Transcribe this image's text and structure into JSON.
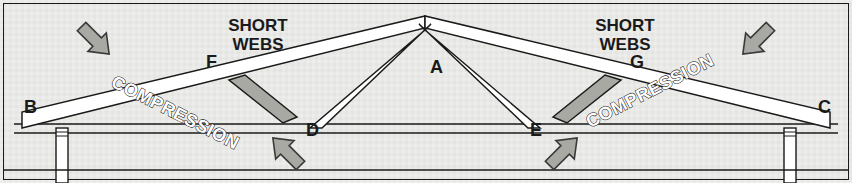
{
  "figure": {
    "name": "roof-truss-compression-diagram",
    "background_color": "#e9e9e7",
    "border_color": "#1a1a1a",
    "member_fill": "#ffffff",
    "member_stroke": "#1a1a1a",
    "short_web_fill": "#a9a9a4",
    "arrow_fill": "#a9a9a4",
    "arrow_stroke": "#3a3a3a",
    "text_color": "#1a1a1a"
  },
  "labels": {
    "short_webs_left": {
      "line1": "SHORT",
      "line2": "WEBS"
    },
    "short_webs_right": {
      "line1": "SHORT",
      "line2": "WEBS"
    },
    "compression_left": "COMPRESSION",
    "compression_right": "COMPRESSION"
  },
  "joints": [
    {
      "id": "A",
      "label": "A",
      "x": 425,
      "y": 22,
      "label_x": 430,
      "label_y": 73,
      "role": "apex"
    },
    {
      "id": "B",
      "label": "B",
      "x": 22,
      "y": 118,
      "label_x": 24,
      "label_y": 113,
      "role": "left-eave"
    },
    {
      "id": "C",
      "label": "C",
      "x": 830,
      "y": 118,
      "label_x": 818,
      "label_y": 113,
      "role": "right-eave"
    },
    {
      "id": "D",
      "label": "D",
      "x": 313,
      "y": 130,
      "label_x": 306,
      "label_y": 136,
      "role": "bottom-chord-left-panel-point"
    },
    {
      "id": "E",
      "label": "E",
      "x": 537,
      "y": 130,
      "label_x": 530,
      "label_y": 136,
      "role": "bottom-chord-right-panel-point"
    },
    {
      "id": "F",
      "label": "F",
      "x": 213,
      "y": 70,
      "label_x": 206,
      "label_y": 68,
      "role": "top-chord-left-panel-point"
    },
    {
      "id": "G",
      "label": "G",
      "x": 637,
      "y": 70,
      "label_x": 630,
      "label_y": 68,
      "role": "top-chord-right-panel-point"
    }
  ],
  "members": [
    {
      "name": "top-chord-left",
      "type": "white-member",
      "points": "22,128 22,112 425,16 425,28"
    },
    {
      "name": "top-chord-right",
      "type": "white-member",
      "points": "830,128 830,112 425,16 425,28"
    },
    {
      "name": "long-web-a-d",
      "type": "white-member",
      "points": "425,30 431,24 322,128 310,128"
    },
    {
      "name": "long-web-a-e",
      "type": "white-member",
      "points": "425,30 419,24 528,128 540,128"
    },
    {
      "name": "short-web-f-d",
      "type": "grey-member",
      "points": "229,80 245,75 297,117 283,123"
    },
    {
      "name": "short-web-g-e",
      "type": "grey-member",
      "points": "621,80 605,75 553,117 567,123"
    }
  ],
  "bottom_chord": {
    "name": "bottom-chord",
    "y_top": 124,
    "y_bottom": 133,
    "x_start": 14,
    "x_end": 838
  },
  "posts": [
    {
      "name": "post-left",
      "x": 56,
      "y": 128,
      "width": 12,
      "height": 55
    },
    {
      "name": "post-right",
      "x": 784,
      "y": 128,
      "width": 12,
      "height": 55
    }
  ],
  "ground_line": {
    "name": "ground-line",
    "y": 170,
    "x_start": 4,
    "x_end": 848
  },
  "load_arrows": [
    {
      "name": "load-arrow-top-left",
      "direction": "down-right",
      "cx": 95,
      "cy": 40,
      "rotation": 45,
      "meaning": "roof load pressing on left top chord"
    },
    {
      "name": "load-arrow-top-right",
      "direction": "down-left",
      "cx": 757,
      "cy": 40,
      "rotation": 135,
      "meaning": "roof load pressing on right top chord"
    },
    {
      "name": "load-arrow-bottom-left",
      "direction": "up-left",
      "cx": 287,
      "cy": 152,
      "rotation": -135,
      "meaning": "reaction pushing toward F-D short web"
    },
    {
      "name": "load-arrow-bottom-right",
      "direction": "up-right",
      "cx": 563,
      "cy": 152,
      "rotation": -45,
      "meaning": "reaction pushing toward G-E short web"
    }
  ],
  "text_positions": {
    "short_webs_left": {
      "x": 258,
      "y": 14,
      "font_size": 17
    },
    "short_webs_right": {
      "x": 625,
      "y": 14,
      "font_size": 17
    },
    "compression_left": {
      "x": 110,
      "y": 86,
      "rotation": 27,
      "font_size": 18
    },
    "compression_right": {
      "x": 590,
      "y": 128,
      "rotation": -27,
      "font_size": 18
    },
    "joint_font_size": 18
  }
}
